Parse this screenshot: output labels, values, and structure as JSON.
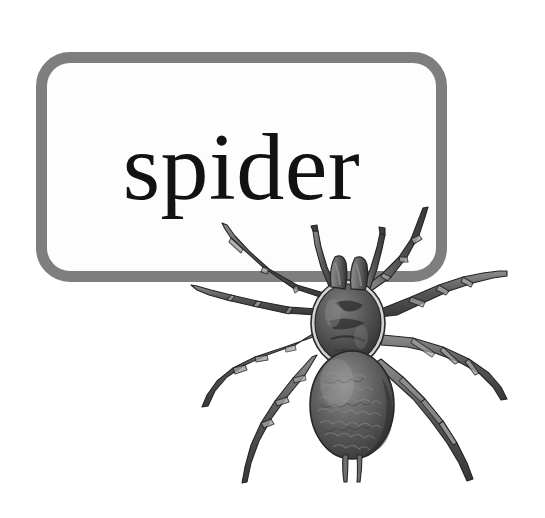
{
  "card": {
    "word": "spider",
    "frame_border_color": "#7e7e7e",
    "frame_fill_color": "#fdfdfd",
    "word_color": "#121212"
  },
  "illustration": {
    "subject": "spider",
    "style": "grayscale engraving",
    "body_parts": {
      "carapace": "cephalothorax",
      "abdomen": "abdomen",
      "chelicerae_count": 2,
      "spinnerets_count": 2,
      "leg_count": 8
    },
    "colors": {
      "dark": "#3b3b3b",
      "mid": "#6e6e6e",
      "light": "#9a9a9a",
      "highlight": "#c4c4c4",
      "outline": "#2a2a2a"
    }
  },
  "background": {
    "color": "#ffffff"
  }
}
